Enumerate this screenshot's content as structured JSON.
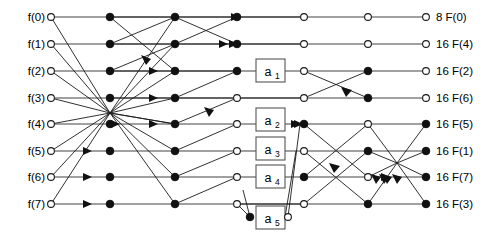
{
  "figure": {
    "width": 494,
    "height": 244,
    "background": "#ffffff",
    "edge_color": "#1a1a1a",
    "rail_color": "#808080",
    "node_open_fill": "#ffffff",
    "node_solid_fill": "#111111",
    "box_stroke": "#555555"
  },
  "inputs": [
    {
      "label": "f(0)",
      "row": 0
    },
    {
      "label": "f(1)",
      "row": 1
    },
    {
      "label": "f(2)",
      "row": 2
    },
    {
      "label": "f(3)",
      "row": 3
    },
    {
      "label": "f(4)",
      "row": 4
    },
    {
      "label": "f(5)",
      "row": 5
    },
    {
      "label": "f(6)",
      "row": 6
    },
    {
      "label": "f(7)",
      "row": 7
    }
  ],
  "outputs": [
    {
      "label": "8 F(0)",
      "coefficient": "8",
      "term": "F(0)",
      "row": 0,
      "node": "open"
    },
    {
      "label": "16 F(4)",
      "coefficient": "16",
      "term": "F(4)",
      "row": 1,
      "node": "open"
    },
    {
      "label": "16 F(2)",
      "coefficient": "16",
      "term": "F(2)",
      "row": 2,
      "node": "open"
    },
    {
      "label": "16 F(6)",
      "coefficient": "16",
      "term": "F(6)",
      "row": 3,
      "node": "open"
    },
    {
      "label": "16 F(5)",
      "coefficient": "16",
      "term": "F(5)",
      "row": 4,
      "node": "solid"
    },
    {
      "label": "16 F(1)",
      "coefficient": "16",
      "term": "F(1)",
      "row": 5,
      "node": "solid"
    },
    {
      "label": "16 F(7)",
      "coefficient": "16",
      "term": "F(7)",
      "row": 6,
      "node": "solid"
    },
    {
      "label": "16 F(3)",
      "coefficient": "16",
      "term": "F(3)",
      "row": 7,
      "node": "solid"
    }
  ],
  "multiplier_boxes": [
    {
      "label": "a",
      "subscript": "1",
      "full": "a1",
      "row": 2,
      "x": 270
    },
    {
      "label": "a",
      "subscript": "2",
      "full": "a2",
      "row": 4,
      "x": 270
    },
    {
      "label": "a",
      "subscript": "3",
      "full": "a3",
      "row": 5,
      "x": 270
    },
    {
      "label": "a",
      "subscript": "4",
      "full": "a4",
      "row": 6,
      "x": 270
    },
    {
      "label": "a",
      "subscript": "5",
      "full": "a5",
      "row": 8,
      "x": 270
    }
  ],
  "geometry": {
    "row_y": [
      17,
      44,
      71,
      98,
      124,
      151,
      177,
      204
    ],
    "extra_row_y": 217,
    "stage_x": [
      51,
      110,
      175,
      237,
      304,
      368,
      426
    ],
    "node_radius_open": 3.4,
    "node_radius_solid": 3.8
  },
  "stages": {
    "count": 7,
    "names": [
      "input",
      "stage-1",
      "stage-2",
      "stage-3",
      "stage-4",
      "stage-5",
      "output"
    ]
  },
  "nodes": [
    {
      "stage": 0,
      "row": 0,
      "type": "open"
    },
    {
      "stage": 0,
      "row": 1,
      "type": "open"
    },
    {
      "stage": 0,
      "row": 2,
      "type": "open"
    },
    {
      "stage": 0,
      "row": 3,
      "type": "open"
    },
    {
      "stage": 0,
      "row": 4,
      "type": "open"
    },
    {
      "stage": 0,
      "row": 5,
      "type": "open"
    },
    {
      "stage": 0,
      "row": 6,
      "type": "open"
    },
    {
      "stage": 0,
      "row": 7,
      "type": "open"
    },
    {
      "stage": 1,
      "row": 0,
      "type": "solid"
    },
    {
      "stage": 1,
      "row": 1,
      "type": "solid"
    },
    {
      "stage": 1,
      "row": 2,
      "type": "solid"
    },
    {
      "stage": 1,
      "row": 3,
      "type": "solid"
    },
    {
      "stage": 1,
      "row": 4,
      "type": "solid"
    },
    {
      "stage": 1,
      "row": 5,
      "type": "solid"
    },
    {
      "stage": 1,
      "row": 6,
      "type": "solid"
    },
    {
      "stage": 1,
      "row": 7,
      "type": "solid"
    },
    {
      "stage": 2,
      "row": 0,
      "type": "solid"
    },
    {
      "stage": 2,
      "row": 1,
      "type": "solid"
    },
    {
      "stage": 2,
      "row": 2,
      "type": "solid"
    },
    {
      "stage": 2,
      "row": 3,
      "type": "solid"
    },
    {
      "stage": 2,
      "row": 4,
      "type": "solid"
    },
    {
      "stage": 2,
      "row": 5,
      "type": "solid"
    },
    {
      "stage": 2,
      "row": 6,
      "type": "solid"
    },
    {
      "stage": 2,
      "row": 7,
      "type": "solid"
    },
    {
      "stage": 3,
      "row": 0,
      "type": "solid"
    },
    {
      "stage": 3,
      "row": 1,
      "type": "solid"
    },
    {
      "stage": 3,
      "row": 2,
      "type": "solid"
    },
    {
      "stage": 3,
      "row": 3,
      "type": "open"
    },
    {
      "stage": 3,
      "row": 4,
      "type": "open"
    },
    {
      "stage": 3,
      "row": 5,
      "type": "open"
    },
    {
      "stage": 3,
      "row": 6,
      "type": "open"
    },
    {
      "stage": 3,
      "row": 7,
      "type": "open"
    },
    {
      "stage": 4,
      "row": 0,
      "type": "open"
    },
    {
      "stage": 4,
      "row": 1,
      "type": "open"
    },
    {
      "stage": 4,
      "row": 2,
      "type": "open"
    },
    {
      "stage": 4,
      "row": 3,
      "type": "open"
    },
    {
      "stage": 4,
      "row": 4,
      "type": "solid"
    },
    {
      "stage": 4,
      "row": 5,
      "type": "open"
    },
    {
      "stage": 4,
      "row": 6,
      "type": "solid"
    },
    {
      "stage": 4,
      "row": 7,
      "type": "open"
    },
    {
      "stage": 5,
      "row": 0,
      "type": "open"
    },
    {
      "stage": 5,
      "row": 1,
      "type": "open"
    },
    {
      "stage": 5,
      "row": 2,
      "type": "solid"
    },
    {
      "stage": 5,
      "row": 3,
      "type": "solid"
    },
    {
      "stage": 5,
      "row": 4,
      "type": "open"
    },
    {
      "stage": 5,
      "row": 5,
      "type": "solid"
    },
    {
      "stage": 5,
      "row": 6,
      "type": "open"
    },
    {
      "stage": 5,
      "row": 7,
      "type": "solid"
    }
  ]
}
